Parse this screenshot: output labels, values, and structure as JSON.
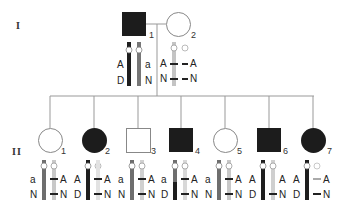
{
  "generations": [
    {
      "label": "I"
    },
    {
      "label": "II"
    }
  ],
  "colors": {
    "affected": "#1a1a1a",
    "unaffected_fill": "#ffffff",
    "outline": "#888888",
    "line": "#999999",
    "dark_chromosome": "#222222",
    "mid_chromosome": "#777777",
    "light_chromosome": "#bbbbbb"
  },
  "individuals": [
    {
      "id": "I-1",
      "number": "1",
      "sex": "male",
      "affected": true,
      "left_alleles": [
        "A",
        "D"
      ],
      "right_alleles": [
        "a",
        "N"
      ],
      "left_chr": "dark",
      "right_chr": "mid"
    },
    {
      "id": "I-2",
      "number": "2",
      "sex": "female",
      "affected": false,
      "left_alleles": [
        "A",
        "N"
      ],
      "right_alleles": [
        "A",
        "N"
      ],
      "left_chr": "light",
      "right_chr": "faint"
    },
    {
      "id": "II-1",
      "number": "1",
      "sex": "female",
      "affected": false,
      "left_alleles": [
        "a",
        "N"
      ],
      "right_alleles": [
        "A",
        "N"
      ],
      "left_chr": "mid",
      "right_chr": "light"
    },
    {
      "id": "II-2",
      "number": "2",
      "sex": "female",
      "affected": true,
      "left_alleles": [
        "A",
        "D"
      ],
      "right_alleles": [
        "A",
        "N"
      ],
      "left_chr": "dark",
      "right_chr": "light"
    },
    {
      "id": "II-3",
      "number": "3",
      "sex": "male",
      "affected": false,
      "left_alleles": [
        "a",
        "N"
      ],
      "right_alleles": [
        "A",
        "N"
      ],
      "left_chr": "mid",
      "right_chr": "light"
    },
    {
      "id": "II-4",
      "number": "4",
      "sex": "male",
      "affected": true,
      "left_alleles": [
        "a",
        "D"
      ],
      "right_alleles": [
        "A",
        "N"
      ],
      "left_chr": "mixed",
      "right_chr": "light"
    },
    {
      "id": "II-5",
      "number": "5",
      "sex": "female",
      "affected": false,
      "left_alleles": [
        "a",
        "N"
      ],
      "right_alleles": [
        "A",
        "N"
      ],
      "left_chr": "mid",
      "right_chr": "light"
    },
    {
      "id": "II-6",
      "number": "6",
      "sex": "male",
      "affected": true,
      "left_alleles": [
        "A",
        "D"
      ],
      "right_alleles": [
        "A",
        "N"
      ],
      "left_chr": "dark",
      "right_chr": "light"
    },
    {
      "id": "II-7",
      "number": "7",
      "sex": "female",
      "affected": true,
      "left_alleles": [
        "A",
        "D"
      ],
      "right_alleles": [
        "A",
        "N"
      ],
      "left_chr": "dark",
      "right_chr": "faint"
    }
  ]
}
